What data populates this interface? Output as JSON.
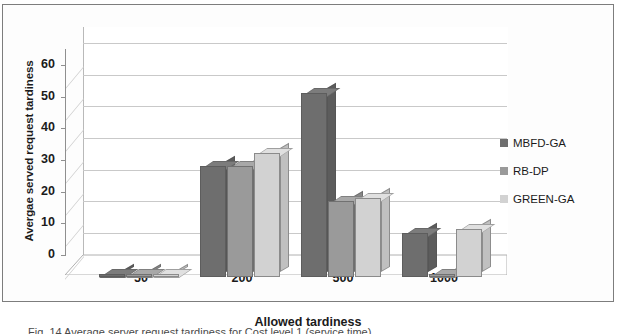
{
  "chart_data": {
    "type": "bar",
    "title": "",
    "xlabel": "Allowed tardiness",
    "ylabel": "Avergae served request tardiness",
    "categories": [
      "50",
      "200",
      "500",
      "1000"
    ],
    "ylim": [
      0,
      65
    ],
    "yticks": [
      0,
      10,
      20,
      30,
      40,
      50,
      60
    ],
    "grid": true,
    "legend_position": "right",
    "series": [
      {
        "name": "MBFD-GA",
        "color": "#6e6e6e",
        "values": [
          1,
          35,
          58,
          14
        ]
      },
      {
        "name": "RB-DP",
        "color": "#9a9a9a",
        "values": [
          1,
          35,
          24,
          1
        ]
      },
      {
        "name": "GREEN-GA",
        "color": "#d2d2d2",
        "values": [
          1,
          39,
          25,
          15
        ]
      }
    ]
  },
  "axis": {
    "y_title": "Avergae served request tardiness",
    "x_title": "Allowed tardiness",
    "y_tick_labels": [
      "60",
      "50",
      "40",
      "30",
      "20",
      "10",
      "0"
    ],
    "x_tick_labels": [
      "50",
      "200",
      "500",
      "1000"
    ]
  },
  "legend": {
    "items": [
      {
        "label": "MBFD-GA",
        "color": "#6e6e6e"
      },
      {
        "label": "RB-DP",
        "color": "#9a9a9a"
      },
      {
        "label": "GREEN-GA",
        "color": "#d2d2d2"
      }
    ]
  },
  "caption": {
    "text": "Fig. 14 Average server request tardiness for Cost level 1 (service time)"
  },
  "colors": {
    "series_dark": "#6e6e6e",
    "series_mid": "#9a9a9a",
    "series_light": "#d2d2d2",
    "gridline": "#c9c9c9",
    "axis": "#8f8f8f",
    "frame": "#7d7d7d",
    "text": "#1b1b1b"
  }
}
